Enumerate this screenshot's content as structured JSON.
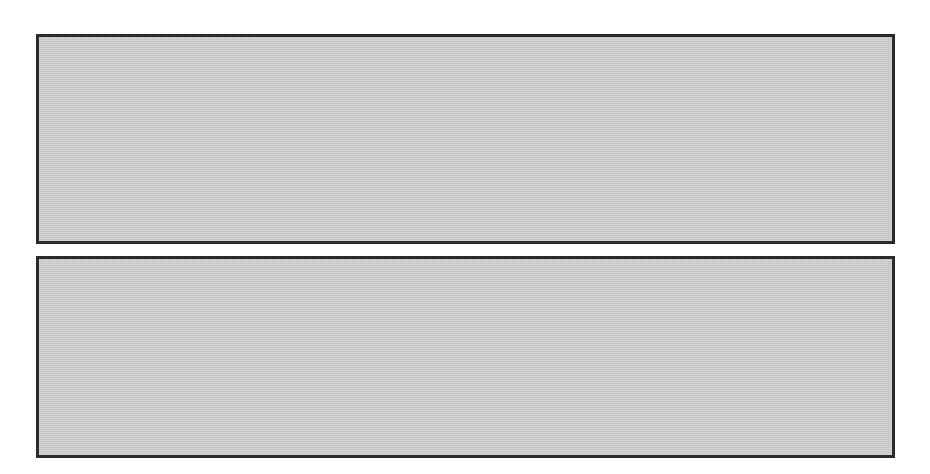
{
  "figure": {
    "background_color": "#ffffff",
    "panel_fill_color": "#c9c9c9",
    "panel_border_color": "#2b2b2b",
    "wave_color": "#262626",
    "axis_color": "#1d1d1d",
    "width": 930,
    "height": 474
  },
  "panels": [
    {
      "id": "top",
      "name": "frequency-shift-keying-waveform",
      "modulation": "FSK",
      "bit_labels": [
        "0",
        "1",
        "0",
        "1",
        "1"
      ],
      "cycles_per_bit": [
        3,
        2,
        3,
        2,
        2
      ],
      "amplitude_per_bit": [
        52,
        52,
        52,
        52,
        52
      ],
      "centerline": "dashed",
      "bit_count": 5
    },
    {
      "id": "bottom",
      "name": "amplitude-shift-keying-waveform",
      "modulation": "ASK",
      "bit_labels": [
        "0",
        "1",
        "0",
        "1",
        "1"
      ],
      "cycles_per_bit": [
        1,
        1,
        1,
        1,
        1
      ],
      "amplitude_per_bit": [
        28,
        48,
        28,
        48,
        48
      ],
      "centerline": "dashed",
      "bit_count": 5
    }
  ],
  "chart_data": {
    "type": "line",
    "title": "",
    "xlabel": "",
    "ylabel": "",
    "series": [
      {
        "name": "FSK signal (top panel)",
        "bits": [
          "0",
          "1",
          "0",
          "1",
          "1"
        ],
        "cycles_per_bit": [
          3,
          2,
          3,
          2,
          2
        ],
        "amplitude": [
          52,
          52,
          52,
          52,
          52
        ]
      },
      {
        "name": "ASK signal (bottom panel)",
        "bits": [
          "0",
          "1",
          "0",
          "1",
          "1"
        ],
        "cycles_per_bit": [
          1,
          1,
          1,
          1,
          1
        ],
        "amplitude": [
          28,
          48,
          28,
          48,
          48
        ]
      }
    ],
    "annotations": [
      "0",
      "1",
      "0",
      "1",
      "1"
    ],
    "grid": false,
    "legend": "none"
  }
}
